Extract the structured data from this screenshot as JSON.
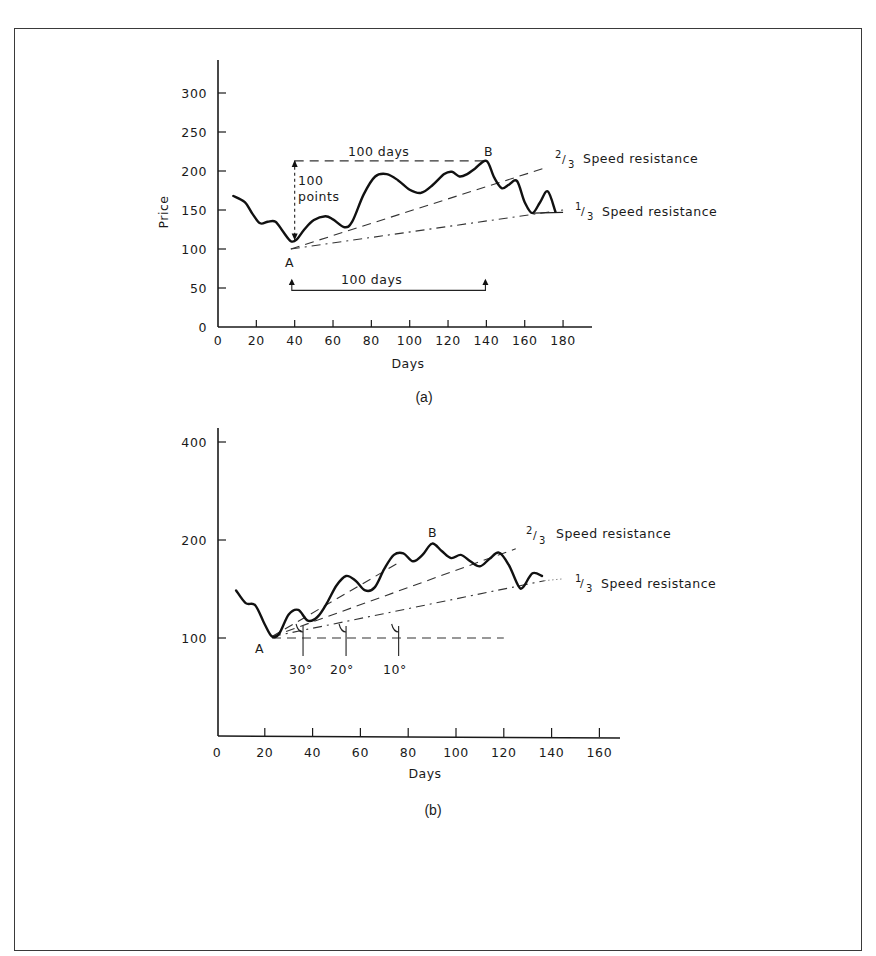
{
  "figure": {
    "panel_a_caption": "(a)",
    "panel_b_caption": "(b)"
  },
  "chart_data": [
    {
      "type": "line",
      "panel": "(a)",
      "title": "",
      "xlabel": "Days",
      "ylabel": "Price",
      "xlim": [
        0,
        190
      ],
      "ylim": [
        0,
        340
      ],
      "x_ticks": [
        0,
        20,
        40,
        60,
        80,
        100,
        120,
        140,
        160,
        180
      ],
      "y_ticks": [
        0,
        50,
        100,
        150,
        200,
        250,
        300
      ],
      "grid": false,
      "series": [
        {
          "name": "Price",
          "x": [
            8,
            14,
            18,
            22,
            26,
            30,
            34,
            38,
            41,
            45,
            50,
            56,
            60,
            66,
            70,
            76,
            82,
            88,
            94,
            100,
            106,
            112,
            118,
            122,
            126,
            130,
            134,
            140,
            144,
            148,
            152,
            156,
            160,
            164,
            168,
            172,
            176
          ],
          "values": [
            168,
            160,
            145,
            133,
            135,
            135,
            122,
            110,
            112,
            125,
            137,
            142,
            138,
            128,
            135,
            170,
            193,
            196,
            188,
            176,
            172,
            182,
            196,
            199,
            193,
            196,
            203,
            213,
            192,
            178,
            183,
            187,
            160,
            146,
            160,
            174,
            148
          ]
        }
      ],
      "reference_lines": [
        {
          "name": "2/3 Speed resistance",
          "from": [
            38,
            100
          ],
          "to": [
            172,
            205
          ],
          "style": "dashed"
        },
        {
          "name": "1/3 Speed resistance",
          "from": [
            38,
            100
          ],
          "to": [
            180,
            150
          ],
          "style": "dash-dot"
        },
        {
          "name": "100 days horizontal (A to B level)",
          "from": [
            40,
            213
          ],
          "to": [
            140,
            213
          ],
          "style": "dashed"
        }
      ],
      "annotations": [
        {
          "text": "A",
          "x": 38,
          "y": 85
        },
        {
          "text": "B",
          "x": 142,
          "y": 228
        },
        {
          "text": "100 days",
          "x": 62,
          "y": 225
        },
        {
          "text": "100",
          "x": 44,
          "y": 190
        },
        {
          "text": "points",
          "x": 44,
          "y": 168
        },
        {
          "text": "100 days",
          "x": 70,
          "y": 60
        },
        {
          "text": "2/3 Speed resistance",
          "x": 182,
          "y": 212
        },
        {
          "text": "1/3 Speed resistance",
          "x": 185,
          "y": 150
        }
      ]
    },
    {
      "type": "line",
      "panel": "(b)",
      "title": "",
      "xlabel": "Days",
      "ylabel": "",
      "xlim": [
        0,
        170
      ],
      "y_scale": "log",
      "y_ticks": [
        100,
        200,
        400
      ],
      "x_ticks": [
        0,
        20,
        40,
        60,
        80,
        100,
        120,
        140,
        160
      ],
      "grid": false,
      "series": [
        {
          "name": "Price",
          "x": [
            8,
            12,
            16,
            20,
            23,
            26,
            30,
            34,
            38,
            42,
            46,
            50,
            54,
            58,
            62,
            66,
            70,
            74,
            78,
            82,
            86,
            90,
            94,
            98,
            102,
            106,
            110,
            114,
            118,
            122,
            126,
            128,
            132,
            136
          ],
          "values": [
            140,
            128,
            126,
            110,
            101,
            103,
            118,
            122,
            113,
            116,
            128,
            145,
            155,
            150,
            140,
            143,
            163,
            180,
            182,
            172,
            180,
            195,
            185,
            176,
            180,
            172,
            166,
            175,
            183,
            168,
            145,
            143,
            158,
            155
          ]
        }
      ],
      "reference_lines": [
        {
          "name": "2/3 Speed resistance",
          "from": [
            23,
            101
          ],
          "to": [
            125,
            188
          ],
          "style": "dashed"
        },
        {
          "name": "1/3 Speed resistance",
          "from": [
            23,
            101
          ],
          "to": [
            137,
            150
          ],
          "style": "dash-dot"
        },
        {
          "name": "30° line",
          "from": [
            23,
            101
          ],
          "to": [
            77,
            172
          ],
          "style": "dashed"
        },
        {
          "name": "horizontal base",
          "from": [
            23,
            100
          ],
          "to": [
            120,
            100
          ],
          "style": "dashed"
        }
      ],
      "annotations": [
        {
          "text": "A",
          "x": 20,
          "y": 94
        },
        {
          "text": "B",
          "x": 90,
          "y": 215
        },
        {
          "text": "30°",
          "x": 33,
          "y": 85
        },
        {
          "text": "20°",
          "x": 52,
          "y": 85
        },
        {
          "text": "10°",
          "x": 76,
          "y": 85
        },
        {
          "text": "2/3 Speed resistance",
          "x": 128,
          "y": 200
        },
        {
          "text": "1/3 Speed resistance",
          "x": 138,
          "y": 155
        }
      ]
    }
  ],
  "labels": {
    "a": {
      "ylabel": "Price",
      "xlabel": "Days",
      "A": "A",
      "B": "B",
      "top_days": "100 days",
      "bottom_days": "100 days",
      "points_1": "100",
      "points_2": "points",
      "two_thirds_num": "2",
      "two_thirds_den": "3",
      "two_thirds_text": "Speed resistance",
      "one_third_num": "1",
      "one_third_den": "3",
      "one_third_text": "Speed resistance"
    },
    "b": {
      "xlabel": "Days",
      "A": "A",
      "B": "B",
      "deg30": "30°",
      "deg20": "20°",
      "deg10": "10°",
      "two_thirds_num": "2",
      "two_thirds_den": "3",
      "two_thirds_text": "Speed resistance",
      "one_third_num": "1",
      "one_third_den": "3",
      "one_third_text": "Speed resistance"
    }
  }
}
